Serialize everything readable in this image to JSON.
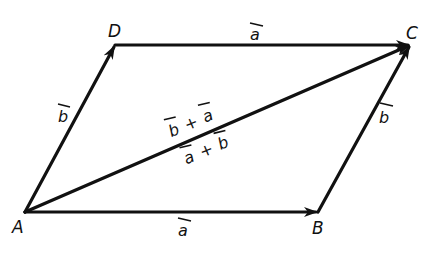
{
  "diagram": {
    "points": {
      "A": {
        "label": "A",
        "x": 25,
        "y": 212
      },
      "B": {
        "label": "B",
        "x": 318,
        "y": 212
      },
      "C": {
        "label": "C",
        "x": 410,
        "y": 45
      },
      "D": {
        "label": "D",
        "x": 115,
        "y": 45
      }
    },
    "vectors": [
      {
        "from": "A",
        "to": "B",
        "label": "a"
      },
      {
        "from": "D",
        "to": "C",
        "label": "a"
      },
      {
        "from": "A",
        "to": "D",
        "label": "b"
      },
      {
        "from": "B",
        "to": "C",
        "label": "b"
      },
      {
        "from": "A",
        "to": "C",
        "label": "b + a / a + b"
      }
    ],
    "labels": {
      "point_a": "A",
      "point_b": "B",
      "point_c": "C",
      "point_d": "D",
      "vec_ab": "a",
      "vec_dc": "a",
      "vec_ad": "b",
      "vec_bc": "b",
      "diag_top_1": "b",
      "diag_top_plus": "+",
      "diag_top_2": "a",
      "diag_bot_1": "a",
      "diag_bot_plus": "+",
      "diag_bot_2": "b"
    },
    "colors": {
      "ink": "#111111",
      "background": "#ffffff"
    }
  }
}
